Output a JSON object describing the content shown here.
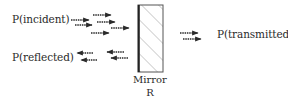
{
  "labels": {
    "incident": "P(incident)",
    "reflected": "P(reflected)",
    "transmitted": "P(transmitted)",
    "mirror": "Mirror",
    "mirror_symbol": "R"
  },
  "colors": {
    "ink": "#2a2a2a",
    "background": "#ffffff"
  }
}
